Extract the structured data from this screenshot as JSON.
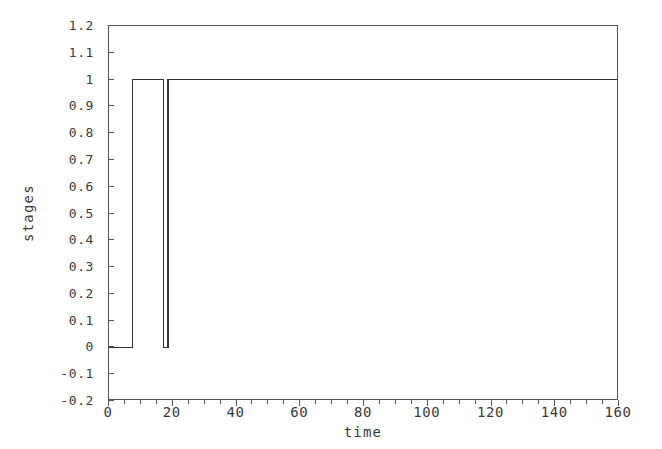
{
  "chart_data": {
    "type": "line",
    "title": "",
    "xlabel": "time",
    "ylabel": "stages",
    "xlim": [
      0,
      160
    ],
    "ylim": [
      -0.2,
      1.2
    ],
    "grid": false,
    "legend": null,
    "x_ticks": [
      0,
      20,
      40,
      60,
      80,
      100,
      120,
      140,
      160
    ],
    "x_tick_labels": [
      "0",
      "20",
      "40",
      "60",
      "80",
      "100",
      "120",
      "140",
      "160"
    ],
    "x_minor_tick_step": 5,
    "y_ticks": [
      -0.2,
      -0.1,
      0,
      0.1,
      0.2,
      0.3,
      0.4,
      0.5,
      0.6,
      0.7,
      0.8,
      0.9,
      1,
      1.1,
      1.2
    ],
    "y_tick_labels": [
      "-0.2",
      "-0.1",
      "0",
      "0.1",
      "0.2",
      "0.3",
      "0.4",
      "0.5",
      "0.6",
      "0.7",
      "0.8",
      "0.9",
      "1",
      "1.1",
      "1.2"
    ],
    "line_color": "#333333",
    "line_width": 1.1,
    "series": [
      {
        "name": "stages",
        "step": "post",
        "x": [
          0,
          7.3,
          7.3,
          17.2,
          17.2,
          18.5,
          18.5,
          21.0,
          21.0,
          160
        ],
        "y": [
          0,
          0,
          1,
          1,
          0,
          0,
          1,
          1,
          1,
          1
        ]
      }
    ]
  }
}
